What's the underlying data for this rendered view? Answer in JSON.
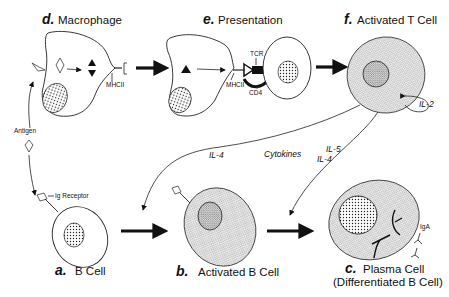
{
  "panels": {
    "d": {
      "letter": "d.",
      "label": "Macrophage"
    },
    "e": {
      "letter": "e.",
      "label": "Presentation"
    },
    "f": {
      "letter": "f.",
      "label": "Activated T Cell"
    },
    "a": {
      "letter": "a.",
      "label": "B Cell"
    },
    "b": {
      "letter": "b.",
      "label": "Activated B Cell"
    },
    "c": {
      "letter": "c.",
      "label": "Plasma Cell",
      "sublabel": "(Differentiated B Cell)"
    }
  },
  "annotations": {
    "mhcii_d": "MHCII",
    "mhcii_e": "MHCII",
    "tcr": "TCR",
    "cd4": "CD4",
    "antigen": "Antigen",
    "ig_receptor": "Ig Receptor",
    "iga": "IgA",
    "il2": "IL-2"
  },
  "cytokines": {
    "label": "Cytokines",
    "to_b": "IL-4",
    "to_c_1": "IL-5",
    "to_c_2": "IL-4"
  }
}
